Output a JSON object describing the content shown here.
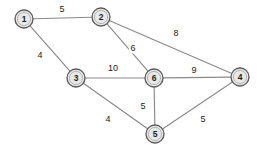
{
  "figure": {
    "background_color": "#ffffff",
    "node_fill_color": "#e8e8e8",
    "node_stroke_color": "#58585a",
    "edge_color": "#8a8a8a",
    "label_color": "#1a1a1a"
  },
  "chart_data": {
    "type": "diagram",
    "diagram_kind": "weighted-undirected-graph",
    "title": "",
    "nodes": [
      {
        "id": "1",
        "label": "1",
        "x": 24,
        "y": 19,
        "r": 9
      },
      {
        "id": "2",
        "label": "2",
        "x": 101,
        "y": 17,
        "r": 9
      },
      {
        "id": "3",
        "label": "3",
        "x": 76,
        "y": 78,
        "r": 9
      },
      {
        "id": "4",
        "label": "4",
        "x": 240,
        "y": 77,
        "r": 9
      },
      {
        "id": "5",
        "label": "5",
        "x": 155,
        "y": 134,
        "r": 9
      },
      {
        "id": "6",
        "label": "6",
        "x": 154,
        "y": 78,
        "r": 9
      }
    ],
    "edges": [
      {
        "source": "1",
        "target": "2",
        "weight": 5,
        "label": "5",
        "lx": 62,
        "ly": 9
      },
      {
        "source": "1",
        "target": "3",
        "weight": 4,
        "label": "4",
        "lx": 40,
        "ly": 55
      },
      {
        "source": "2",
        "target": "6",
        "weight": 6,
        "label": "6",
        "lx": 133,
        "ly": 48
      },
      {
        "source": "2",
        "target": "4",
        "weight": 8,
        "label": "8",
        "lx": 176,
        "ly": 33
      },
      {
        "source": "3",
        "target": "6",
        "weight": 10,
        "label": "10",
        "lx": 113,
        "ly": 68
      },
      {
        "source": "3",
        "target": "5",
        "weight": 4,
        "label": "4",
        "lx": 108,
        "ly": 119
      },
      {
        "source": "6",
        "target": "4",
        "weight": 9,
        "label": "9",
        "lx": 194,
        "ly": 70
      },
      {
        "source": "6",
        "target": "5",
        "weight": 5,
        "label": "5",
        "lx": 143,
        "ly": 106
      },
      {
        "source": "5",
        "target": "4",
        "weight": 5,
        "label": "5",
        "lx": 203,
        "ly": 119
      }
    ],
    "node_count": 6,
    "edge_count": 9
  }
}
